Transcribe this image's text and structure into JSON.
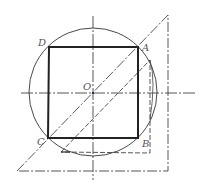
{
  "diagram": {
    "type": "geometry-construction",
    "colors": {
      "stroke": "#222222",
      "thin": "#444444",
      "label": "#555555",
      "background": "#ffffff"
    },
    "labels": {
      "A": "A",
      "B": "B",
      "C": "C",
      "D": "D",
      "O": "O"
    },
    "points": {
      "O": [
        93,
        93
      ],
      "A": [
        138,
        47
      ],
      "B": [
        138,
        138
      ],
      "C": [
        48,
        138
      ],
      "D": [
        49,
        47
      ]
    },
    "circle": {
      "cx": 93,
      "cy": 92,
      "r": 64
    },
    "square": {
      "vertices": [
        "D",
        "A",
        "B",
        "C"
      ]
    },
    "axes": {
      "horizontal": {
        "x1": 21,
        "x2": 195,
        "y": 93
      },
      "vertical": {
        "x": 93,
        "y1": 16,
        "y2": 180
      }
    },
    "outer_triangle": [
      [
        17,
        171
      ],
      [
        168,
        15
      ],
      [
        168,
        171
      ]
    ],
    "inner_triangle": [
      [
        61,
        152
      ],
      [
        150,
        60
      ],
      [
        150,
        153
      ]
    ]
  }
}
